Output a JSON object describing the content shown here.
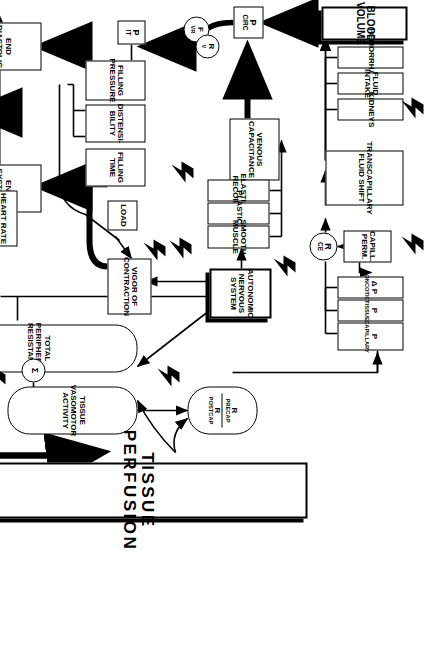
{
  "diagram": {
    "orientation": "rotated-90-clockwise",
    "goal_label": "THE GOAL",
    "cloud_label_line1": "Toxins &",
    "cloud_label_line2": "Hypoxia",
    "sigma_symbol": "Σ"
  },
  "nodes": {
    "blood_volume": "BLOOD VOLUME",
    "hemorrhage": "HEMORRHAGE",
    "fluid_intake": "FLUID INTAKE",
    "kidneys": "KIDNEYS",
    "transcapillary_fluid_shift_l1": "TRANSCAPILLARY",
    "transcapillary_fluid_shift_l2": "FLUID SHIFT",
    "capill_perm_l1": "CAPILL.",
    "capill_perm_l2": "PERM.",
    "r_ce_base": "R",
    "r_ce_sub": "CE",
    "delta_p_oncotic_pre": "Δ P",
    "delta_p_oncotic_sub": "ONCOTIC",
    "p_tissue_pre": "P",
    "p_tissue_sub": "TISSUE",
    "p_capillary_pre": "P",
    "p_capillary_sub": "CAPILLARY",
    "p_circ_pre": "P",
    "p_circ_sub": "CIRC",
    "venous_capacitance_l1": "VENOUS",
    "venous_capacitance_l2": "CAPACITANCE",
    "elastic_recoil": "ELASTIC RECOIL",
    "plasticity": "PLASTICITY",
    "smooth_muscle": "SMOOTH MUSCLE",
    "autonomic_l1": "AUTONOMIC",
    "autonomic_l2": "NERVOUS",
    "autonomic_l3": "SYSTEM",
    "f_vr_pre": "F",
    "f_vr_sub": "VR",
    "r_v_pre": "R",
    "r_v_sub": "V",
    "p_it_pre": "P",
    "p_it_sub": "IT",
    "filling_pressure_l1": "FILLING",
    "filling_pressure_l2": "PRESSURE",
    "distensibility_l1": "DISTENSI-",
    "distensibility_l2": "BILITY",
    "filling_time_l1": "FILLING",
    "filling_time_l2": "TIME",
    "load": "LOAD",
    "vigor_l1": "VIGOR OF",
    "vigor_l2": "CONTRACTION",
    "end_diastolic_l1": "END DIASTOLIC",
    "end_diastolic_l2": "VOLUME",
    "end_systolic_l1": "END SYSTOLIC",
    "end_systolic_l2": "VOLUME",
    "stroke_volume_l1": "STROKE",
    "stroke_volume_l2": "VOLUME",
    "heart_rate": "HEART RATE",
    "cardiac_output_l1": "CARDIAC",
    "cardiac_output_l2": "OUTPUT",
    "total_peripheral_resistance": "TOTAL PERIPHERAL RESISTANCE",
    "tissue_vasomotor_l1": "TISSUE VASOMOTOR",
    "tissue_vasomotor_l2": "ACTIVITY",
    "r_precap_num_pre": "R",
    "r_precap_num_sub": "PRECAP",
    "r_postcap_den_pre": "R",
    "r_postcap_den_sub": "POSTCAP",
    "systemic_arterial_l1": "SYSTEMIC",
    "systemic_arterial_l2": "ARTERIAL",
    "systemic_arterial_l3": "PRESSURE",
    "tissue_perfusion": "TISSUE PERFUSION"
  },
  "colors": {
    "ink": "#000000",
    "paper": "#ffffff"
  }
}
